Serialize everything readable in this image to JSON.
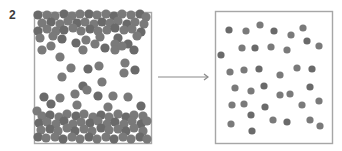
{
  "figure": {
    "label": "2",
    "colors": {
      "box_border": "#a6a6a6",
      "particle": "#7a7a7a",
      "particle_dark": "#6a6a6a",
      "arrow": "#8a8a8a",
      "label": "#3a3a3a"
    },
    "left_box": {
      "x": 34,
      "y": 12,
      "w": 117,
      "h": 131,
      "description": "dense particles concentrated at top and bottom",
      "r": 4.6,
      "particles": [
        [
          38,
          15
        ],
        [
          47,
          15
        ],
        [
          55,
          16
        ],
        [
          64,
          14
        ],
        [
          72,
          16
        ],
        [
          80,
          14
        ],
        [
          89,
          14
        ],
        [
          97,
          15
        ],
        [
          106,
          14
        ],
        [
          114,
          16
        ],
        [
          122,
          14
        ],
        [
          131,
          15
        ],
        [
          140,
          14
        ],
        [
          146,
          17
        ],
        [
          42,
          23
        ],
        [
          51,
          22
        ],
        [
          60,
          24
        ],
        [
          68,
          21
        ],
        [
          77,
          23
        ],
        [
          85,
          22
        ],
        [
          94,
          24
        ],
        [
          102,
          22
        ],
        [
          110,
          23
        ],
        [
          118,
          21
        ],
        [
          127,
          24
        ],
        [
          135,
          22
        ],
        [
          144,
          24
        ],
        [
          38,
          31
        ],
        [
          47,
          29
        ],
        [
          56,
          31
        ],
        [
          64,
          30
        ],
        [
          73,
          28
        ],
        [
          81,
          31
        ],
        [
          90,
          29
        ],
        [
          98,
          31
        ],
        [
          107,
          30
        ],
        [
          115,
          28
        ],
        [
          124,
          30
        ],
        [
          132,
          29
        ],
        [
          141,
          32
        ],
        [
          40,
          38
        ],
        [
          53,
          36
        ],
        [
          62,
          39
        ],
        [
          86,
          40
        ],
        [
          100,
          37
        ],
        [
          118,
          38
        ],
        [
          137,
          36
        ],
        [
          51,
          46
        ],
        [
          76,
          43
        ],
        [
          95,
          44
        ],
        [
          115,
          44
        ],
        [
          128,
          44
        ],
        [
          42,
          50
        ],
        [
          83,
          50
        ],
        [
          105,
          48
        ],
        [
          115,
          50
        ],
        [
          122,
          46
        ],
        [
          134,
          50
        ],
        [
          60,
          57
        ],
        [
          71,
          68
        ],
        [
          88,
          69
        ],
        [
          99,
          66
        ],
        [
          125,
          63
        ],
        [
          135,
          70
        ],
        [
          124,
          73
        ],
        [
          62,
          77
        ],
        [
          83,
          86
        ],
        [
          87,
          90
        ],
        [
          102,
          82
        ],
        [
          44,
          97
        ],
        [
          60,
          98
        ],
        [
          75,
          94
        ],
        [
          98,
          96
        ],
        [
          113,
          96
        ],
        [
          128,
          97
        ],
        [
          51,
          104
        ],
        [
          77,
          105
        ],
        [
          108,
          107
        ],
        [
          141,
          106
        ],
        [
          37,
          111
        ],
        [
          42,
          116
        ],
        [
          50,
          115
        ],
        [
          59,
          117
        ],
        [
          67,
          114
        ],
        [
          76,
          116
        ],
        [
          84,
          114
        ],
        [
          93,
          117
        ],
        [
          101,
          115
        ],
        [
          109,
          117
        ],
        [
          118,
          114
        ],
        [
          126,
          117
        ],
        [
          134,
          115
        ],
        [
          143,
          116
        ],
        [
          39,
          123
        ],
        [
          47,
          122
        ],
        [
          56,
          124
        ],
        [
          64,
          121
        ],
        [
          73,
          124
        ],
        [
          81,
          122
        ],
        [
          90,
          123
        ],
        [
          98,
          121
        ],
        [
          107,
          124
        ],
        [
          115,
          122
        ],
        [
          124,
          124
        ],
        [
          132,
          121
        ],
        [
          141,
          124
        ],
        [
          147,
          121
        ],
        [
          41,
          130
        ],
        [
          50,
          129
        ],
        [
          58,
          131
        ],
        [
          67,
          128
        ],
        [
          75,
          131
        ],
        [
          84,
          129
        ],
        [
          92,
          131
        ],
        [
          101,
          128
        ],
        [
          109,
          130
        ],
        [
          118,
          129
        ],
        [
          126,
          131
        ],
        [
          134,
          128
        ],
        [
          143,
          131
        ],
        [
          38,
          137
        ],
        [
          46,
          138
        ],
        [
          55,
          137
        ],
        [
          63,
          139
        ],
        [
          72,
          137
        ],
        [
          80,
          139
        ],
        [
          89,
          137
        ],
        [
          97,
          139
        ],
        [
          106,
          137
        ],
        [
          114,
          139
        ],
        [
          123,
          137
        ],
        [
          131,
          139
        ],
        [
          140,
          137
        ],
        [
          147,
          139
        ]
      ]
    },
    "arrow": {
      "x1": 158,
      "y1": 77,
      "x2": 208,
      "y2": 77,
      "direction": "right"
    },
    "right_box": {
      "x": 215,
      "y": 11,
      "w": 117,
      "h": 132,
      "description": "particles evenly spread throughout",
      "r": 3.6,
      "particles": [
        [
          229,
          30
        ],
        [
          246,
          31
        ],
        [
          260,
          25
        ],
        [
          274,
          31
        ],
        [
          291,
          35
        ],
        [
          303,
          28
        ],
        [
          307,
          41
        ],
        [
          319,
          46
        ],
        [
          242,
          48
        ],
        [
          255,
          48
        ],
        [
          271,
          47
        ],
        [
          287,
          50
        ],
        [
          221,
          55
        ],
        [
          230,
          72
        ],
        [
          244,
          70
        ],
        [
          259,
          69
        ],
        [
          280,
          75
        ],
        [
          297,
          68
        ],
        [
          312,
          69
        ],
        [
          235,
          88
        ],
        [
          251,
          91
        ],
        [
          264,
          86
        ],
        [
          280,
          95
        ],
        [
          290,
          94
        ],
        [
          310,
          87
        ],
        [
          232,
          105
        ],
        [
          244,
          104
        ],
        [
          265,
          107
        ],
        [
          302,
          105
        ],
        [
          319,
          101
        ],
        [
          251,
          115
        ],
        [
          231,
          124
        ],
        [
          273,
          120
        ],
        [
          287,
          122
        ],
        [
          310,
          120
        ],
        [
          320,
          126
        ],
        [
          252,
          131
        ]
      ]
    }
  }
}
